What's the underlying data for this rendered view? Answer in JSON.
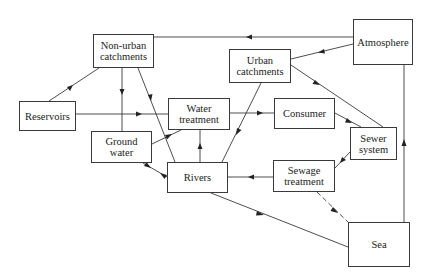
{
  "diagram": {
    "nodes": {
      "non_urban": {
        "line1": "Non-urban",
        "line2": "catchments"
      },
      "reservoirs": {
        "line1": "Reservoirs"
      },
      "water_treatment": {
        "line1": "Water",
        "line2": "treatment"
      },
      "ground_water": {
        "line1": "Ground",
        "line2": "water"
      },
      "rivers": {
        "line1": "Rivers"
      },
      "urban": {
        "line1": "Urban",
        "line2": "catchments"
      },
      "atmosphere": {
        "line1": "Atmosphere"
      },
      "consumer": {
        "line1": "Consumer"
      },
      "sewer": {
        "line1": "Sewer",
        "line2": "system"
      },
      "sewage_treatment": {
        "line1": "Sewage",
        "line2": "treatment"
      },
      "sea": {
        "line1": "Sea"
      }
    },
    "edges": [
      {
        "from": "Atmosphere",
        "to": "Non-urban catchments",
        "style": "solid"
      },
      {
        "from": "Atmosphere",
        "to": "Urban catchments",
        "style": "solid"
      },
      {
        "from": "Atmosphere",
        "to": "Sea",
        "style": "solid",
        "note": "Sea to Atmosphere arrow up"
      },
      {
        "from": "Non-urban catchments",
        "to": "Reservoirs",
        "style": "solid"
      },
      {
        "from": "Non-urban catchments",
        "to": "Ground water",
        "style": "solid"
      },
      {
        "from": "Non-urban catchments",
        "to": "Rivers",
        "style": "solid"
      },
      {
        "from": "Reservoirs",
        "to": "Water treatment",
        "style": "solid"
      },
      {
        "from": "Ground water",
        "to": "Water treatment",
        "style": "solid"
      },
      {
        "from": "Ground water",
        "to": "Rivers",
        "style": "solid",
        "bidirectional": true
      },
      {
        "from": "Rivers",
        "to": "Water treatment",
        "style": "solid"
      },
      {
        "from": "Water treatment",
        "to": "Consumer",
        "style": "solid"
      },
      {
        "from": "Urban catchments",
        "to": "Rivers",
        "style": "solid"
      },
      {
        "from": "Urban catchments",
        "to": "Sewer system",
        "style": "solid"
      },
      {
        "from": "Consumer",
        "to": "Sewer system",
        "style": "solid"
      },
      {
        "from": "Sewer system",
        "to": "Sewage treatment",
        "style": "solid"
      },
      {
        "from": "Sewage treatment",
        "to": "Rivers",
        "style": "solid"
      },
      {
        "from": "Sewage treatment",
        "to": "Sea",
        "style": "dashed"
      },
      {
        "from": "Rivers",
        "to": "Sea",
        "style": "solid"
      }
    ]
  }
}
